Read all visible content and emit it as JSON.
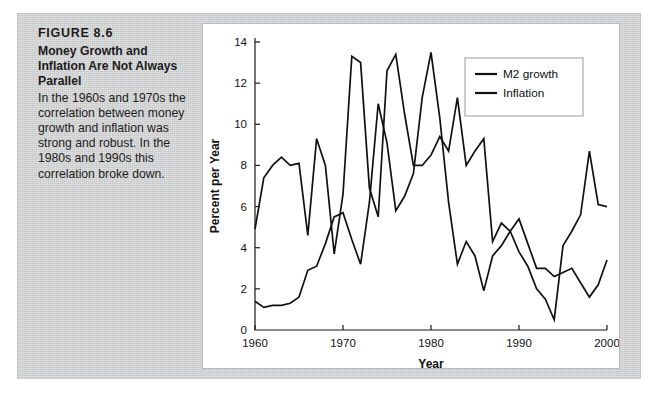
{
  "figure": {
    "number": "FIGURE 8.6",
    "title": "Money Growth and Inflation Are Not Always Parallel",
    "description": "In the 1960s and 1970s the correlation between money growth and inflation was strong and robust. In the 1980s and 1990s this correlation broke down.",
    "panel_color": "#cfd0d1",
    "card_color": "#ffffff",
    "ink_color": "#111111"
  },
  "chart_data": {
    "type": "line",
    "title": "",
    "subtitle": "",
    "xlabel": "Year",
    "ylabel": "Percent per Year",
    "xlim": [
      1960,
      2000
    ],
    "ylim": [
      0,
      14
    ],
    "xticks": [
      1960,
      1970,
      1980,
      1990,
      2000
    ],
    "xticklabels": [
      "1960",
      "1970",
      "1980",
      "1990",
      "2000"
    ],
    "yticks": [
      0,
      2,
      4,
      6,
      8,
      10,
      12,
      14
    ],
    "yticklabels": [
      "0",
      "2",
      "4",
      "6",
      "8",
      "10",
      "12",
      "14"
    ],
    "grid": false,
    "legend_position": "top-right",
    "x": [
      1960,
      1961,
      1962,
      1963,
      1964,
      1965,
      1966,
      1967,
      1968,
      1969,
      1970,
      1971,
      1972,
      1973,
      1974,
      1975,
      1976,
      1977,
      1978,
      1979,
      1980,
      1981,
      1982,
      1983,
      1984,
      1985,
      1986,
      1987,
      1988,
      1989,
      1990,
      1991,
      1992,
      1993,
      1994,
      1995,
      1996,
      1997,
      1998,
      1999,
      2000
    ],
    "series": [
      {
        "name": "M2 growth",
        "color": "#111111",
        "values": [
          4.9,
          7.4,
          8.0,
          8.4,
          8.0,
          8.1,
          4.6,
          9.3,
          8.0,
          3.7,
          6.6,
          13.3,
          13.0,
          6.9,
          5.5,
          12.6,
          13.4,
          10.5,
          8.0,
          8.0,
          8.5,
          9.4,
          8.7,
          11.3,
          8.0,
          8.7,
          9.3,
          4.3,
          5.2,
          4.8,
          3.8,
          3.1,
          2.0,
          1.5,
          0.5,
          4.1,
          4.8,
          5.6,
          8.7,
          6.1,
          6.0
        ]
      },
      {
        "name": "Inflation",
        "color": "#111111",
        "values": [
          1.4,
          1.1,
          1.2,
          1.2,
          1.3,
          1.6,
          2.9,
          3.1,
          4.2,
          5.5,
          5.7,
          4.4,
          3.2,
          6.2,
          11.0,
          9.1,
          5.8,
          6.5,
          7.6,
          11.3,
          13.5,
          10.3,
          6.2,
          3.2,
          4.3,
          3.6,
          1.9,
          3.6,
          4.1,
          4.8,
          5.4,
          4.2,
          3.0,
          3.0,
          2.6,
          2.8,
          3.0,
          2.3,
          1.6,
          2.2,
          3.4
        ]
      }
    ]
  }
}
